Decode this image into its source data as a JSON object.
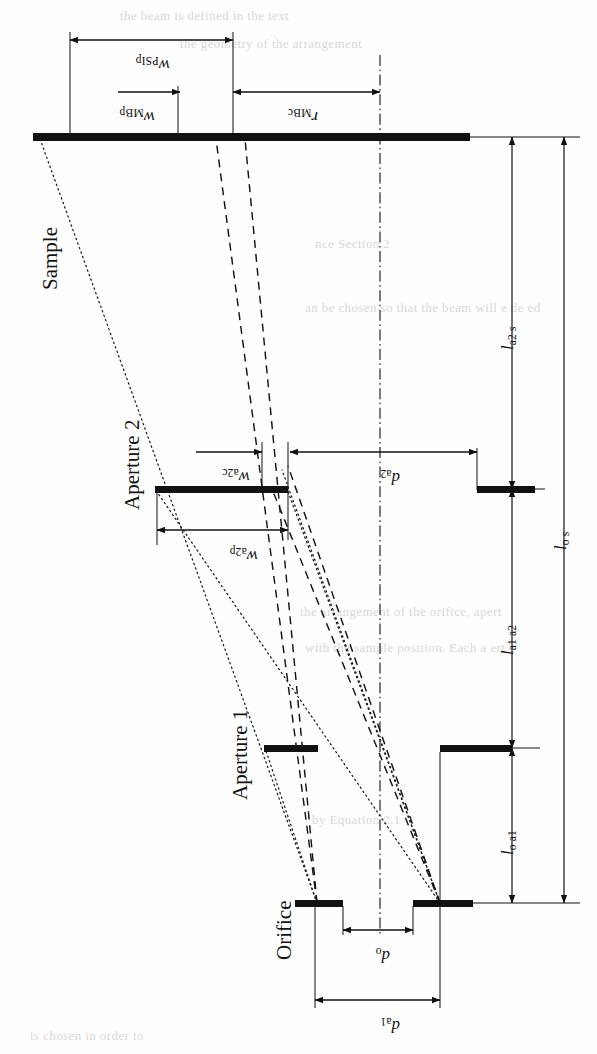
{
  "figure": {
    "orientation": "rotated-90",
    "type": "optical-beamline-diagram"
  },
  "components": [
    {
      "id": "sample",
      "label": "Sample",
      "axis_y": 137
    },
    {
      "id": "aperture2",
      "label": "Aperture 2",
      "axis_y": 489
    },
    {
      "id": "aperture1",
      "label": "Aperture 1",
      "axis_y": 748
    },
    {
      "id": "orifice",
      "label": "Orifice",
      "axis_y": 903
    }
  ],
  "dimensions": {
    "widths_at_sample": [
      {
        "id": "w_PSIp",
        "var": "w",
        "sub": "PSIp",
        "desc": "PSI beam width at sample plane"
      },
      {
        "id": "w_MBp",
        "var": "w",
        "sub": "MBp",
        "desc": "molecular beam width at sample plane"
      },
      {
        "id": "r_MBc",
        "var": "r",
        "sub": "MBc",
        "desc": "molecular beam centre radius"
      }
    ],
    "widths_at_aperture2": [
      {
        "id": "w_a2c",
        "var": "w",
        "sub": "a2c",
        "desc": "beam width at aperture 2 centre side"
      },
      {
        "id": "w_a2p",
        "var": "w",
        "sub": "a2p",
        "desc": "beam width at aperture 2 penumbra side"
      }
    ],
    "diameters": [
      {
        "id": "d_a2",
        "var": "d",
        "sub": "a2",
        "desc": "aperture 2 diameter"
      },
      {
        "id": "d_o",
        "var": "d",
        "sub": "o",
        "desc": "orifice diameter"
      },
      {
        "id": "d_a1",
        "var": "d",
        "sub": "a1",
        "desc": "aperture 1 diameter"
      }
    ],
    "lengths": [
      {
        "id": "l_a2s",
        "var": "l",
        "sub": "a2 s",
        "desc": "aperture 2 to sample distance"
      },
      {
        "id": "l_a1a2",
        "var": "l",
        "sub": "a1 a2",
        "desc": "aperture 1 to aperture 2 distance"
      },
      {
        "id": "l_oa1",
        "var": "l",
        "sub": "o a1",
        "desc": "orifice to aperture 1 distance"
      },
      {
        "id": "l_os",
        "var": "l",
        "sub": "o s",
        "desc": "orifice to sample distance"
      }
    ]
  },
  "line_styles": {
    "component_bar": "thick-solid",
    "centre_axis": "dash-dot",
    "beam_edge_outer": "dotted",
    "beam_edge_inner": "dashed",
    "dimension_line": "thin-solid-with-arrows"
  },
  "colors": {
    "ink": "#111111",
    "paper": "#fefefe",
    "ghost_text": "#d8d8d8"
  },
  "ghost_text": [
    {
      "t": "the beam  is  defined  in  the  text",
      "x": 120,
      "y": 8
    },
    {
      "t": "the geometry  of  the  arrangement",
      "x": 180,
      "y": 36
    },
    {
      "t": "nce Section 2",
      "x": 315,
      "y": 236
    },
    {
      "t": "an be  chosen  so  that  the  beam  will  e  de  ed",
      "x": 305,
      "y": 300
    },
    {
      "t": "the  arrangement  of  the  orifice,  apert",
      "x": 300,
      "y": 604
    },
    {
      "t": "with  the  sample  position.  Each  a  ert",
      "x": 305,
      "y": 640
    },
    {
      "t": "by  Equation  2.1",
      "x": 312,
      "y": 812
    },
    {
      "t": "is  chosen  in  order  to",
      "x": 30,
      "y": 1028
    }
  ]
}
